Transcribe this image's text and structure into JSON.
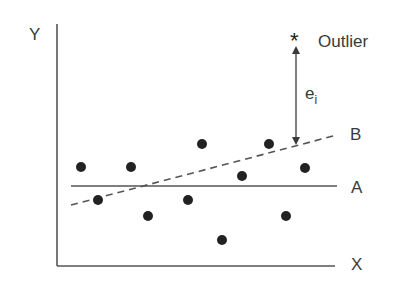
{
  "figure": {
    "y_axis_label": "Y",
    "x_axis_label": "X",
    "line_a_label": "A",
    "line_b_label": "B",
    "outlier_marker": "*",
    "outlier_label": "Outlier",
    "residual_label_base": "e",
    "residual_label_sub": "i"
  },
  "colors": {
    "ink": "#3a3a3a",
    "points": "#222222",
    "background": "#ffffff"
  },
  "geometry": {
    "axes": {
      "origin": [
        57,
        266
      ],
      "y_top": 24,
      "x_right": 335
    },
    "line_a": {
      "y": 186,
      "x1": 71,
      "x2": 337
    },
    "line_b": {
      "x1": 71,
      "y1": 205,
      "x2": 337,
      "y2": 135,
      "style": "dashed"
    },
    "outlier": {
      "x": 296,
      "y": 38
    },
    "residual_arrow": {
      "x": 296,
      "y1": 47,
      "y2": 143
    },
    "points": [
      [
        81,
        167
      ],
      [
        131,
        167
      ],
      [
        202,
        144
      ],
      [
        98,
        200
      ],
      [
        188,
        200
      ],
      [
        148,
        216
      ],
      [
        222,
        240
      ],
      [
        269,
        144
      ],
      [
        242,
        176
      ],
      [
        305,
        168
      ],
      [
        286,
        216
      ]
    ]
  }
}
